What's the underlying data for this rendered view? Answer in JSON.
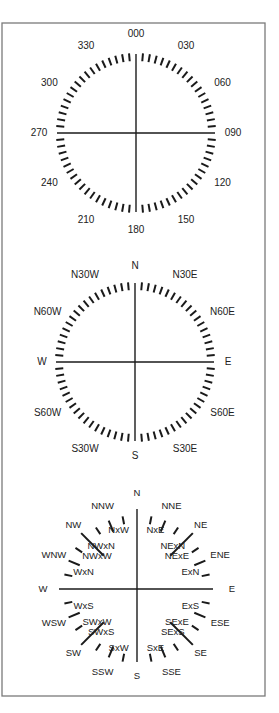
{
  "figure": {
    "frame": {
      "x": 2,
      "y": 23,
      "width": 263,
      "height": 673,
      "stroke": "#7a7a7a"
    },
    "ink_color": "#1a1a1a",
    "roses": [
      {
        "name": "degree-rose",
        "center": [
          136,
          133
        ],
        "axis_radius": 79,
        "tick_outer": 80,
        "tick_inner": 72,
        "tick_step_deg": 5,
        "label_font_size": 10,
        "labels": [
          {
            "text": "000",
            "angle": 0,
            "r": 99
          },
          {
            "text": "030",
            "angle": 30,
            "r": 100
          },
          {
            "text": "060",
            "angle": 60,
            "r": 100
          },
          {
            "text": "090",
            "angle": 90,
            "r": 97
          },
          {
            "text": "120",
            "angle": 120,
            "r": 100
          },
          {
            "text": "150",
            "angle": 150,
            "r": 100
          },
          {
            "text": "180",
            "angle": 180,
            "r": 97
          },
          {
            "text": "210",
            "angle": 210,
            "r": 100
          },
          {
            "text": "240",
            "angle": 240,
            "r": 100
          },
          {
            "text": "270",
            "angle": 270,
            "r": 97
          },
          {
            "text": "300",
            "angle": 300,
            "r": 100
          },
          {
            "text": "330",
            "angle": 330,
            "r": 100
          }
        ]
      },
      {
        "name": "quadrant-rose",
        "center": [
          135,
          362
        ],
        "axis_radius": 79,
        "tick_outer": 80,
        "tick_inner": 72,
        "tick_step_deg": 5,
        "label_font_size": 10,
        "labels": [
          {
            "text": "N",
            "angle": 0,
            "r": 96
          },
          {
            "text": "N30E",
            "angle": 30,
            "r": 100
          },
          {
            "text": "N60E",
            "angle": 60,
            "r": 101
          },
          {
            "text": "E",
            "angle": 90,
            "r": 93
          },
          {
            "text": "S60E",
            "angle": 120,
            "r": 101
          },
          {
            "text": "S30E",
            "angle": 150,
            "r": 100
          },
          {
            "text": "S",
            "angle": 180,
            "r": 94
          },
          {
            "text": "S30W",
            "angle": 210,
            "r": 100
          },
          {
            "text": "S60W",
            "angle": 240,
            "r": 101
          },
          {
            "text": "W",
            "angle": 270,
            "r": 93
          },
          {
            "text": "N60W",
            "angle": 300,
            "r": 101
          },
          {
            "text": "N30W",
            "angle": 330,
            "r": 100
          }
        ]
      },
      {
        "name": "point-rose",
        "center": [
          137,
          589
        ],
        "axis_top": 509,
        "axis_bottom": 662,
        "axis_left": 59,
        "axis_right": 213,
        "label_font_size": 9.5,
        "points": [
          {
            "text": "N",
            "angle": 0,
            "kind": "cardinal",
            "lr": 96
          },
          {
            "text": "NxE",
            "angle": 11.25,
            "kind": "by",
            "lr": 62
          },
          {
            "text": "NNE",
            "angle": 22.5,
            "kind": "three",
            "lr": 90
          },
          {
            "text": "NExN",
            "angle": 33.75,
            "kind": "by",
            "lr": 56
          },
          {
            "text": "NE",
            "angle": 45,
            "kind": "inter",
            "lr": 90
          },
          {
            "text": "NExE",
            "angle": 56.25,
            "kind": "by",
            "lr": 52
          },
          {
            "text": "ENE",
            "angle": 67.5,
            "kind": "three",
            "lr": 90
          },
          {
            "text": "ExN",
            "angle": 78.75,
            "kind": "by",
            "lr": 56
          },
          {
            "text": "E",
            "angle": 90,
            "kind": "cardinal",
            "lr": 95
          },
          {
            "text": "ExS",
            "angle": 101.25,
            "kind": "by",
            "lr": 56
          },
          {
            "text": "ESE",
            "angle": 112.5,
            "kind": "three",
            "lr": 90
          },
          {
            "text": "SExE",
            "angle": 123.75,
            "kind": "by",
            "lr": 52
          },
          {
            "text": "SE",
            "angle": 135,
            "kind": "inter",
            "lr": 90
          },
          {
            "text": "SExS",
            "angle": 146.25,
            "kind": "by",
            "lr": 56
          },
          {
            "text": "SSE",
            "angle": 157.5,
            "kind": "three",
            "lr": 90
          },
          {
            "text": "SxE",
            "angle": 168.75,
            "kind": "by",
            "lr": 62
          },
          {
            "text": "S",
            "angle": 180,
            "kind": "cardinal",
            "lr": 87
          },
          {
            "text": "SxW",
            "angle": 191.25,
            "kind": "by",
            "lr": 62
          },
          {
            "text": "SSW",
            "angle": 202.5,
            "kind": "three",
            "lr": 90
          },
          {
            "text": "SWxS",
            "angle": 213.75,
            "kind": "by",
            "lr": 56
          },
          {
            "text": "SW",
            "angle": 225,
            "kind": "inter",
            "lr": 90
          },
          {
            "text": "SWxW",
            "angle": 236.25,
            "kind": "by",
            "lr": 52
          },
          {
            "text": "WSW",
            "angle": 247.5,
            "kind": "three",
            "lr": 90
          },
          {
            "text": "WxS",
            "angle": 258.75,
            "kind": "by",
            "lr": 56
          },
          {
            "text": "W",
            "angle": 270,
            "kind": "cardinal",
            "lr": 94
          },
          {
            "text": "WxN",
            "angle": 281.25,
            "kind": "by",
            "lr": 56
          },
          {
            "text": "WNW",
            "angle": 292.5,
            "kind": "three",
            "lr": 90
          },
          {
            "text": "NWxW",
            "angle": 303.75,
            "kind": "by",
            "lr": 52
          },
          {
            "text": "NW",
            "angle": 315,
            "kind": "inter",
            "lr": 90
          },
          {
            "text": "NWxN",
            "angle": 326.25,
            "kind": "by",
            "lr": 56
          },
          {
            "text": "NNW",
            "angle": 337.5,
            "kind": "three",
            "lr": 90
          },
          {
            "text": "NxW",
            "angle": 348.75,
            "kind": "by",
            "lr": 62
          }
        ],
        "tick_lengths": {
          "inter": [
            47,
            79
          ],
          "three": [
            62,
            74
          ],
          "by": [
            66,
            74
          ]
        }
      }
    ]
  }
}
